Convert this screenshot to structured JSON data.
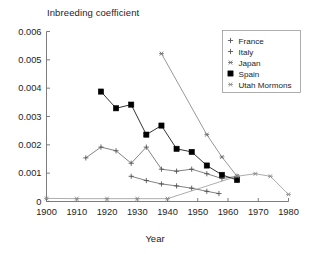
{
  "chart_data": {
    "type": "line",
    "title": "Inbreeding coefficient",
    "xlabel": "Year",
    "ylabel": "",
    "xlim": [
      1900,
      1980
    ],
    "ylim": [
      0,
      0.006
    ],
    "xticks": [
      "1900",
      "1910",
      "1920",
      "1930",
      "1940",
      "1950",
      "1960",
      "1970",
      "1980"
    ],
    "xtick_values": [
      1900,
      1910,
      1920,
      1930,
      1940,
      1950,
      1960,
      1970,
      1980
    ],
    "yticks": [
      "0",
      "0.001",
      "0.002",
      "0.003",
      "0.004",
      "0.005",
      "0.006"
    ],
    "ytick_values": [
      0,
      0.001,
      0.002,
      0.003,
      0.004,
      0.005,
      0.006
    ],
    "grid": false,
    "legend_position": "top-right",
    "series": [
      {
        "name": "France",
        "marker": "plus",
        "color": "#4d4d4d",
        "x": [
          1928,
          1933,
          1938,
          1943,
          1948,
          1953,
          1957
        ],
        "y": [
          0.00089,
          0.00074,
          0.00062,
          0.00055,
          0.00047,
          0.00036,
          0.00028
        ]
      },
      {
        "name": "Italy",
        "marker": "plus",
        "color": "#4d4d4d",
        "x": [
          1913,
          1918,
          1923,
          1928,
          1933,
          1938,
          1943,
          1948,
          1953,
          1958,
          1963
        ],
        "y": [
          0.00154,
          0.00192,
          0.00179,
          0.00135,
          0.00192,
          0.00114,
          0.00107,
          0.00114,
          0.00098,
          0.00081,
          0.00089
        ]
      },
      {
        "name": "Japan",
        "marker": "star",
        "color": "#6b6b6b",
        "x": [
          1938,
          1953,
          1958,
          1963
        ],
        "y": [
          0.00522,
          0.00236,
          0.00157,
          0.00089
        ]
      },
      {
        "name": "Spain",
        "marker": "filled-square",
        "color": "#000000",
        "x": [
          1918,
          1923,
          1928,
          1933,
          1938,
          1943,
          1948,
          1953,
          1958,
          1963
        ],
        "y": [
          0.00388,
          0.00329,
          0.00342,
          0.00236,
          0.00268,
          0.00186,
          0.00175,
          0.00127,
          0.00094,
          0.00076
        ]
      },
      {
        "name": "Utah Mormons",
        "marker": "star",
        "color": "#8a8a8a",
        "x": [
          1900,
          1910,
          1920,
          1930,
          1940,
          1963,
          1969,
          1974,
          1980
        ],
        "y": [
          0.00011,
          0.0001,
          0.0001,
          0.0001,
          0.0001,
          0.00089,
          0.00098,
          0.00089,
          0.00025
        ]
      }
    ],
    "legend_entries": [
      "France",
      "Italy",
      "Japan",
      "Spain",
      "Utah Mormons"
    ]
  },
  "style": {
    "axis_color": "#6e6e6e",
    "text_color": "#1d1d1d",
    "background": "#ffffff",
    "legend_border": "#9a9a9a"
  }
}
